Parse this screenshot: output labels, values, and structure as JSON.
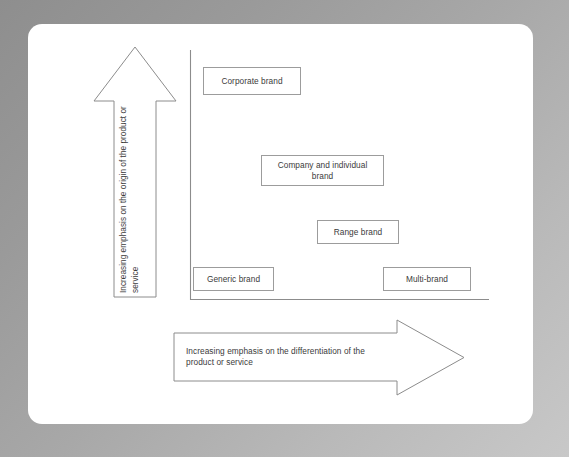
{
  "diagram": {
    "colors": {
      "frame_gray": "#a8a8a8",
      "card_white": "#ffffff",
      "line_gray": "#8c8c8c",
      "box_border": "#9c9c9c",
      "text": "#3b3b3b"
    },
    "axes": {
      "vertical_axis_label": "Increasing emphasis on the origin of the product or\nservice",
      "horizontal_axis_label": "Increasing emphasis on the differentiation of the\nproduct or service"
    },
    "boxes": [
      {
        "id": "corporate-brand",
        "label": "Corporate brand"
      },
      {
        "id": "company-and-individual-brand",
        "label": "Company and individual\nbrand"
      },
      {
        "id": "range-brand",
        "label": "Range brand"
      },
      {
        "id": "generic-brand",
        "label": "Generic brand"
      },
      {
        "id": "multi-brand",
        "label": "Multi-brand"
      }
    ]
  }
}
